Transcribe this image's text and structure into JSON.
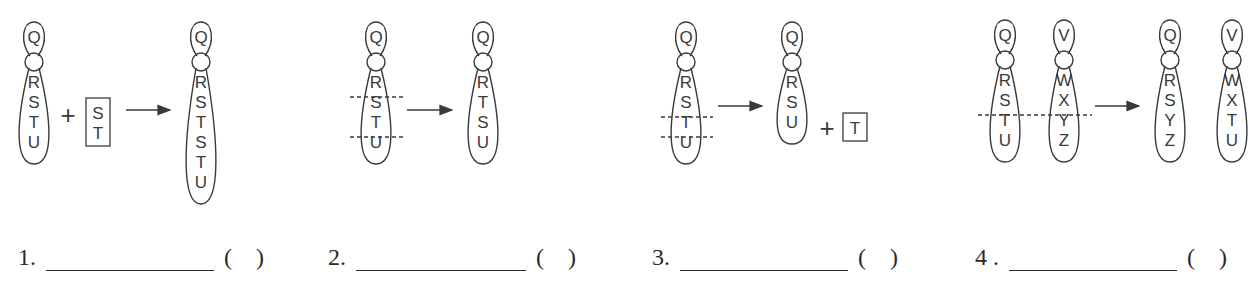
{
  "panels": [
    {
      "id": 1,
      "number_label": "1.",
      "answer_blank": "",
      "answer_parens": "(    )",
      "before": {
        "chromosomes": [
          {
            "top": "Q",
            "bottom": [
              "R",
              "S",
              "T",
              "U"
            ]
          }
        ],
        "plus_fragment": [
          "S",
          "T"
        ]
      },
      "after": {
        "chromosomes": [
          {
            "top": "Q",
            "bottom": [
              "R",
              "S",
              "T",
              "S",
              "T",
              "U"
            ]
          }
        ]
      }
    },
    {
      "id": 2,
      "number_label": "2.",
      "answer_blank": "",
      "answer_parens": "(    )",
      "before": {
        "chromosomes": [
          {
            "top": "Q",
            "bottom": [
              "R",
              "S",
              "T",
              "U"
            ]
          }
        ],
        "cut_lines": "between R|S and T|U"
      },
      "after": {
        "chromosomes": [
          {
            "top": "Q",
            "bottom": [
              "R",
              "T",
              "S",
              "U"
            ]
          }
        ]
      }
    },
    {
      "id": 3,
      "number_label": "3.",
      "answer_blank": "",
      "answer_parens": "(    )",
      "before": {
        "chromosomes": [
          {
            "top": "Q",
            "bottom": [
              "R",
              "S",
              "T",
              "U"
            ]
          }
        ],
        "cut_lines": "between S|T and T|U"
      },
      "after": {
        "chromosomes": [
          {
            "top": "Q",
            "bottom": [
              "R",
              "S",
              "U"
            ]
          }
        ],
        "plus_fragment": [
          "T"
        ]
      }
    },
    {
      "id": 4,
      "number_label": "4 .",
      "answer_blank": "",
      "answer_parens": "(    )",
      "before": {
        "chromosomes": [
          {
            "top": "Q",
            "bottom": [
              "R",
              "S",
              "T",
              "U"
            ]
          },
          {
            "top": "V",
            "bottom": [
              "W",
              "X",
              "Y",
              "Z"
            ]
          }
        ],
        "cut_lines": "between S|T and X|Y across both"
      },
      "after": {
        "chromosomes": [
          {
            "top": "Q",
            "bottom": [
              "R",
              "S",
              "Y",
              "Z"
            ]
          },
          {
            "top": "V",
            "bottom": [
              "W",
              "X",
              "T",
              "U"
            ]
          }
        ]
      }
    }
  ],
  "symbols": {
    "plus": "+",
    "arrow": "arrow-right"
  }
}
